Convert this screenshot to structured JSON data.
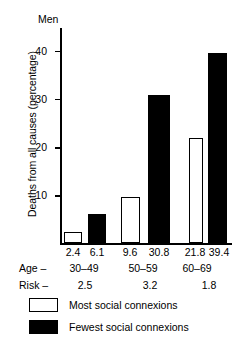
{
  "chart_data": {
    "type": "bar",
    "title": "Men",
    "xlabel": "",
    "ylabel": "Deaths from all causes (percentage)",
    "ylim": [
      0,
      45
    ],
    "yticks": [
      10,
      20,
      30,
      40
    ],
    "ytick_labels": [
      "10",
      "20",
      "30",
      "40"
    ],
    "grid": false,
    "legend_position": "bottom-left",
    "categories": [
      "30-49",
      "50-59",
      "60-69"
    ],
    "series": [
      {
        "name": "Most social connexions",
        "values": [
          2.4,
          9.6,
          21.8
        ],
        "color": "#ffffff"
      },
      {
        "name": "Fewest social connexions",
        "values": [
          6.1,
          30.8,
          39.4
        ],
        "color": "#000000"
      }
    ],
    "bar_value_labels": [
      "2.4",
      "6.1",
      "9.6",
      "30.8",
      "21.8",
      "39.4"
    ],
    "annotations": {
      "age_row_label": "Age –",
      "age_values": [
        "30–49",
        "50–59",
        "60–69"
      ],
      "risk_row_label": "Risk –",
      "risk_values": [
        "2.5",
        "3.2",
        "1.8"
      ]
    }
  },
  "axis": {
    "title": "Men",
    "ylabel": "Deaths from all causes (percentage)",
    "ticks": [
      {
        "label": "40",
        "value": 40
      },
      {
        "label": "30",
        "value": 30
      },
      {
        "label": "20",
        "value": 20
      },
      {
        "label": "10",
        "value": 10
      }
    ]
  },
  "bars": [
    {
      "value_label": "2.4",
      "value": 2.4,
      "group": "30–49",
      "series": "Most social connexions"
    },
    {
      "value_label": "6.1",
      "value": 6.1,
      "group": "30–49",
      "series": "Fewest social connexions"
    },
    {
      "value_label": "9.6",
      "value": 9.6,
      "group": "50–59",
      "series": "Most social connexions"
    },
    {
      "value_label": "30.8",
      "value": 30.8,
      "group": "50–59",
      "series": "Fewest social connexions"
    },
    {
      "value_label": "21.8",
      "value": 21.8,
      "group": "60–69",
      "series": "Most social connexions"
    },
    {
      "value_label": "39.4",
      "value": 39.4,
      "group": "60–69",
      "series": "Fewest social connexions"
    }
  ],
  "rows": {
    "age_label": "Age –",
    "age": [
      "30–49",
      "50–59",
      "60–69"
    ],
    "risk_label": "Risk –",
    "risk": [
      "2.5",
      "3.2",
      "1.8"
    ]
  },
  "legend": [
    {
      "label": "Most social connexions",
      "swatch": "white"
    },
    {
      "label": "Fewest social connexions",
      "swatch": "black"
    }
  ]
}
